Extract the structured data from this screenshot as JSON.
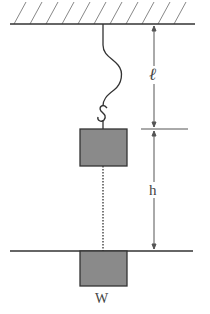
{
  "diagram": {
    "labels": {
      "cord_length": "ℓ",
      "drop_height": "h",
      "weight": "W"
    },
    "colors": {
      "line": "#333333",
      "hatch": "#888888",
      "block_fill": "#8a8a8a",
      "block_stroke": "#333333",
      "label": "#444444"
    }
  }
}
